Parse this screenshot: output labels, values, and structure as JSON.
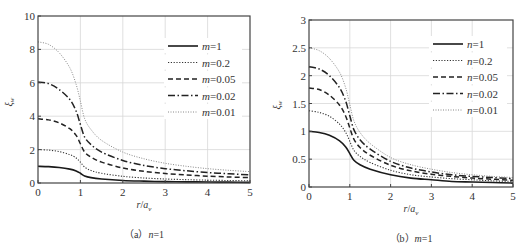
{
  "chart_data": [
    {
      "type": "line",
      "panel": "a",
      "caption": "（a）n=1",
      "title": "",
      "xlabel": "r/a_v",
      "ylabel": "ξ_w",
      "xlim": [
        0,
        5
      ],
      "ylim": [
        0,
        10
      ],
      "xticks": [
        0,
        1,
        2,
        3,
        4,
        5
      ],
      "yticks": [
        0,
        2,
        4,
        6,
        8,
        10
      ],
      "grid": true,
      "legend_position": "upper right",
      "x": [
        0,
        0.25,
        0.5,
        0.75,
        0.9,
        1.0,
        1.1,
        1.25,
        1.5,
        2,
        2.5,
        3,
        3.5,
        4,
        4.5,
        5
      ],
      "series": [
        {
          "name": "m=1",
          "style": "solid",
          "values": [
            1.0,
            0.98,
            0.93,
            0.83,
            0.72,
            0.58,
            0.42,
            0.32,
            0.24,
            0.15,
            0.11,
            0.08,
            0.07,
            0.06,
            0.05,
            0.04
          ]
        },
        {
          "name": "m=0.2",
          "style": "dotted",
          "values": [
            2.0,
            1.97,
            1.88,
            1.7,
            1.5,
            1.25,
            0.95,
            0.75,
            0.58,
            0.4,
            0.3,
            0.24,
            0.2,
            0.17,
            0.15,
            0.13
          ]
        },
        {
          "name": "m=0.05",
          "style": "dashed",
          "values": [
            3.85,
            3.78,
            3.6,
            3.25,
            2.85,
            2.35,
            1.85,
            1.55,
            1.25,
            0.9,
            0.7,
            0.57,
            0.48,
            0.41,
            0.36,
            0.32
          ]
        },
        {
          "name": "m=0.02",
          "style": "dashdot",
          "values": [
            6.05,
            5.95,
            5.6,
            5.0,
            4.3,
            3.5,
            2.75,
            2.3,
            1.85,
            1.35,
            1.05,
            0.86,
            0.73,
            0.63,
            0.55,
            0.49
          ]
        },
        {
          "name": "m=0.01",
          "style": "dotted-light",
          "values": [
            8.45,
            8.3,
            7.8,
            6.9,
            5.9,
            4.9,
            3.85,
            3.2,
            2.55,
            1.85,
            1.45,
            1.18,
            1.0,
            0.86,
            0.76,
            0.68
          ]
        }
      ]
    },
    {
      "type": "line",
      "panel": "b",
      "caption": "（b）m=1",
      "title": "",
      "xlabel": "r/a_v",
      "ylabel": "ξ_w",
      "xlim": [
        0,
        5
      ],
      "ylim": [
        0,
        3
      ],
      "xticks": [
        0,
        1,
        2,
        3,
        4,
        5
      ],
      "yticks": [
        0,
        0.5,
        1,
        1.5,
        2,
        2.5,
        3
      ],
      "grid": true,
      "legend_position": "upper right",
      "x": [
        0,
        0.25,
        0.5,
        0.75,
        0.9,
        1.0,
        1.1,
        1.25,
        1.5,
        2,
        2.5,
        3,
        3.5,
        4,
        4.5,
        5
      ],
      "series": [
        {
          "name": "n=1",
          "style": "solid",
          "values": [
            1.0,
            0.98,
            0.93,
            0.83,
            0.72,
            0.6,
            0.48,
            0.4,
            0.32,
            0.22,
            0.16,
            0.13,
            0.1,
            0.09,
            0.08,
            0.07
          ]
        },
        {
          "name": "n=0.2",
          "style": "dotted",
          "values": [
            1.37,
            1.34,
            1.27,
            1.13,
            0.98,
            0.82,
            0.66,
            0.55,
            0.44,
            0.3,
            0.22,
            0.18,
            0.15,
            0.13,
            0.11,
            0.1
          ]
        },
        {
          "name": "n=0.05",
          "style": "dashed",
          "values": [
            1.78,
            1.75,
            1.65,
            1.47,
            1.27,
            1.06,
            0.86,
            0.71,
            0.57,
            0.39,
            0.29,
            0.23,
            0.19,
            0.16,
            0.14,
            0.12
          ]
        },
        {
          "name": "n=0.02",
          "style": "dashdot",
          "values": [
            2.16,
            2.12,
            2.0,
            1.78,
            1.54,
            1.28,
            1.03,
            0.85,
            0.68,
            0.46,
            0.34,
            0.27,
            0.22,
            0.19,
            0.17,
            0.15
          ]
        },
        {
          "name": "n=0.01",
          "style": "dotted-light",
          "values": [
            2.5,
            2.45,
            2.31,
            2.06,
            1.78,
            1.48,
            1.19,
            0.98,
            0.78,
            0.53,
            0.4,
            0.32,
            0.26,
            0.22,
            0.19,
            0.17
          ]
        }
      ]
    }
  ],
  "panels": {
    "a": {
      "caption_prefix": "（a）",
      "caption_var": "n",
      "caption_eq": "=1",
      "xlabel_r": "r",
      "xlabel_slash": "/",
      "xlabel_a": "a",
      "xlabel_sub": "v",
      "ylabel_main": "ξ",
      "ylabel_sub": "w",
      "yticks": [
        "0",
        "2",
        "4",
        "6",
        "8",
        "10"
      ],
      "xticks": [
        "0",
        "1",
        "2",
        "3",
        "4",
        "5"
      ],
      "legend": [
        "m=1",
        "m=0.2",
        "m=0.05",
        "m=0.02",
        "m=0.01"
      ]
    },
    "b": {
      "caption_prefix": "（b）",
      "caption_var": "m",
      "caption_eq": "=1",
      "xlabel_r": "r",
      "xlabel_slash": "/",
      "xlabel_a": "a",
      "xlabel_sub": "v",
      "ylabel_main": "ξ",
      "ylabel_sub": "w",
      "yticks": [
        "0",
        "0.5",
        "1",
        "1.5",
        "2",
        "2.5",
        "3"
      ],
      "xticks": [
        "0",
        "1",
        "2",
        "3",
        "4",
        "5"
      ],
      "legend": [
        "n=1",
        "n=0.2",
        "n=0.05",
        "n=0.02",
        "n=0.01"
      ]
    }
  },
  "colors": {
    "axis": "#444444",
    "grid": "#d8d8d8",
    "solid": "#1a1a1a",
    "dotted": "#333333",
    "dashed": "#222222",
    "dashdot": "#222222",
    "dotted_light": "#888888"
  }
}
